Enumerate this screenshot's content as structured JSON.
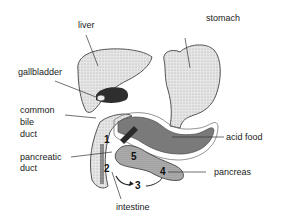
{
  "diagram": {
    "labels": {
      "liver": "liver",
      "stomach": "stomach",
      "gallbladder": "gallbladder",
      "common_bile_duct": [
        "common",
        "bile",
        "duct"
      ],
      "pancreatic_duct": [
        "pancreatic",
        "duct"
      ],
      "acid_food": "acid food",
      "pancreas": "pancreas",
      "intestine": "intestine"
    },
    "numbers": [
      "1",
      "2",
      "3",
      "4",
      "5"
    ],
    "colors": {
      "organ_fill": "#dcdcdc",
      "organ_outline": "#555555",
      "acid_food": "#7a7a7a",
      "dark_shading": "#2a2a2a",
      "leader_line": "#333333"
    }
  }
}
